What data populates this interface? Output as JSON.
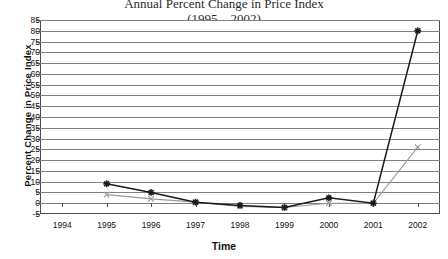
{
  "chart_data": {
    "type": "line",
    "title": "Annual Percent Change in Price Index",
    "title_line2": "(1995 – 2002)",
    "xlabel": "Time",
    "ylabel": "Percent Change in Price Index",
    "categories": [
      "1994",
      "1995",
      "1996",
      "1997",
      "1998",
      "1999",
      "2000",
      "2001",
      "2002"
    ],
    "x": [
      1994,
      1995,
      1996,
      1997,
      1998,
      1999,
      2000,
      2001,
      2002
    ],
    "xlim": [
      1993.5,
      2002.5
    ],
    "ylim": [
      -5,
      85
    ],
    "ytick_step": 5,
    "yticks": [
      -5,
      0,
      5,
      10,
      15,
      20,
      25,
      30,
      35,
      40,
      45,
      50,
      55,
      60,
      65,
      70,
      75,
      80,
      85
    ],
    "grid": true,
    "legend_position": "none",
    "series": [
      {
        "name": "Series 1",
        "color": "#1a1a1a",
        "marker": "asterisk",
        "x": [
          1995,
          1996,
          1997,
          1998,
          1999,
          2000,
          2001,
          2002
        ],
        "values": [
          9,
          5,
          0.5,
          -1,
          -2,
          2.5,
          0,
          80
        ]
      },
      {
        "name": "Series 2",
        "color": "#999999",
        "marker": "x",
        "x": [
          1995,
          1996,
          1997,
          1998,
          1999,
          2000,
          2001,
          2002
        ],
        "values": [
          4,
          2,
          0.5,
          -1.5,
          -2,
          0,
          0,
          26
        ]
      }
    ]
  }
}
